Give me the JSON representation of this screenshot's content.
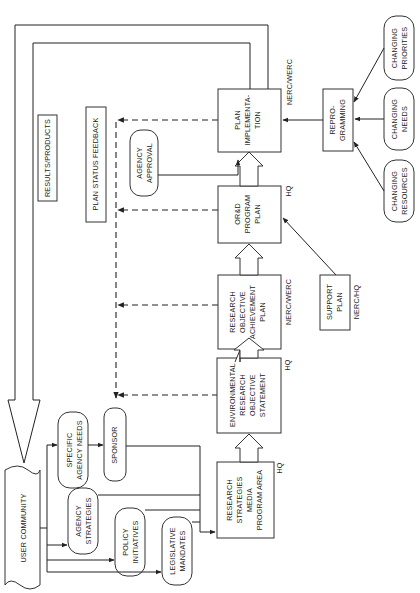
{
  "diagram": {
    "orientation": "rotated-90-ccw",
    "user_community": "USER COMMUNITY",
    "feedback_labels": {
      "results_products": "RESULTS/PRODUCTS",
      "plan_status_feedback": "PLAN STATUS FEEDBACK"
    },
    "inputs": {
      "specific_agency_needs": [
        "SPECIFIC",
        "AGENCY NEEDS"
      ],
      "sponsor": "SPONSOR",
      "agency_strategies": [
        "AGENCY",
        "STRATEGIES"
      ],
      "policy_initiatives": [
        "POLICY",
        "INITIATIVES"
      ],
      "legislative_mandates": [
        "LEGISLATIVE",
        "MANDATES"
      ],
      "agency_approval": [
        "AGENCY",
        "APPROVAL"
      ]
    },
    "main_flow": [
      {
        "lines": [
          "RESEARCH",
          "STRATEGIES",
          "MEDIA",
          "PROGRAM AREA"
        ],
        "level": "HQ"
      },
      {
        "lines": [
          "ENVIRONMENTAL",
          "RESEARCH",
          "OBJECTIVE",
          "STATEMENT"
        ],
        "level": "HQ"
      },
      {
        "lines": [
          "RESEARCH",
          "OBJECTIVE",
          "ACHIEVEMENT",
          "PLAN"
        ],
        "level": "NERC/WERC"
      },
      {
        "lines": [
          "OR&D",
          "PROGRAM",
          "PLAN"
        ],
        "level": "HQ"
      },
      {
        "lines": [
          "PLAN",
          "IMPLEMENTA-",
          "TION"
        ],
        "level": "NERC/WERC"
      }
    ],
    "support_plan": {
      "lines": [
        "SUPPORT",
        "PLAN"
      ],
      "level": "NERC/HQ"
    },
    "reprogramming": [
      "REPRO-",
      "GRAMMING"
    ],
    "change_drivers": [
      [
        "CHANGING",
        "RESOURCES"
      ],
      [
        "CHANGING",
        "NEEDS"
      ],
      [
        "CHANGING",
        "PRIORITIES"
      ]
    ]
  }
}
